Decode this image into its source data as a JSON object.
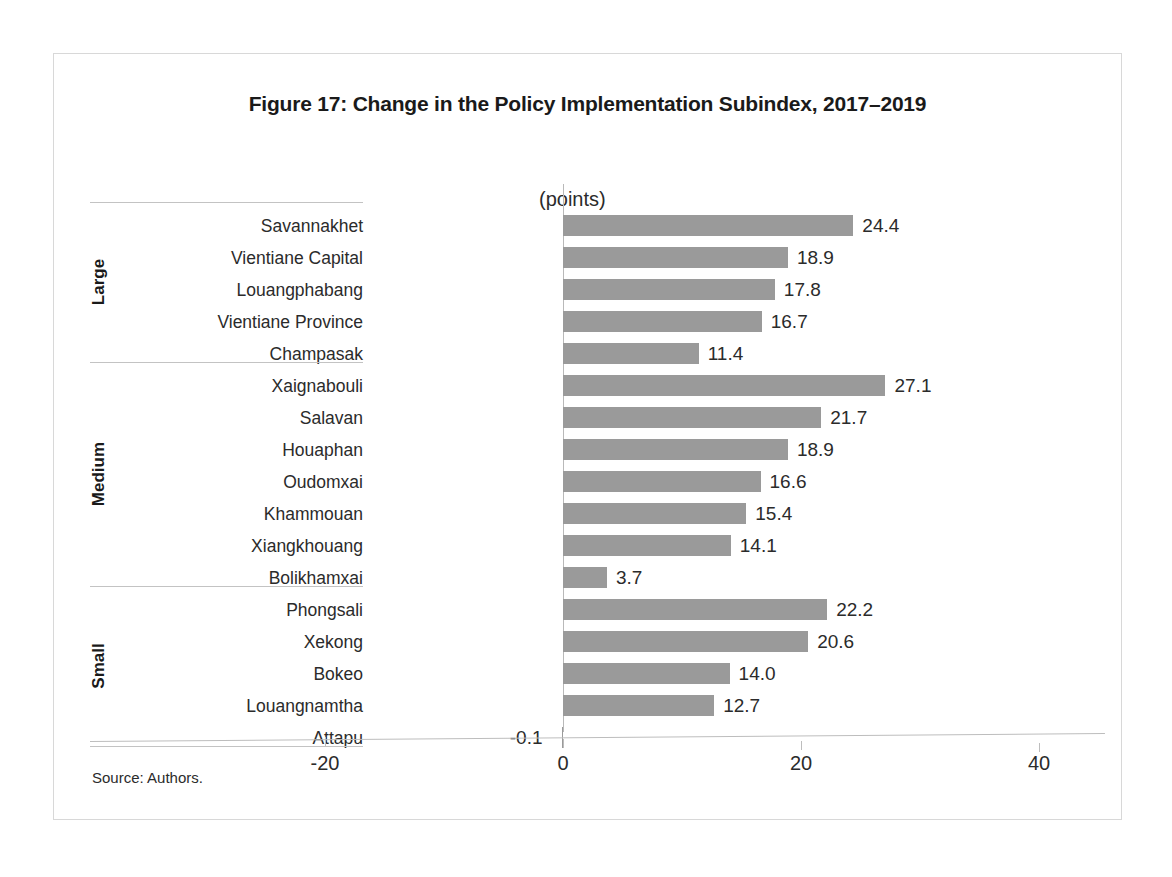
{
  "figure": {
    "title": "Figure 17: Change in the Policy Implementation Subindex, 2017–2019",
    "source_note": "Source: Authors.",
    "axis_unit_label": "(points)",
    "bar_color": "#9a9a9a",
    "frame_border_color": "#d8d8d8",
    "axis_color": "#bdbdbd"
  },
  "chart_data": {
    "type": "bar",
    "orientation": "horizontal",
    "title": "Figure 17: Change in the Policy Implementation Subindex, 2017–2019",
    "xlabel": "(points)",
    "ylabel": "",
    "xlim": [
      -30,
      40
    ],
    "xticks": [
      -20,
      0,
      20,
      40
    ],
    "xtick_labels": [
      "-20",
      "0",
      "20",
      "40"
    ],
    "grid": false,
    "legend": null,
    "categories": [
      "Savannakhet",
      "Vientiane Capital",
      "Louangphabang",
      "Vientiane Province",
      "Champasak",
      "Xaignabouli",
      "Salavan",
      "Houaphan",
      "Oudomxai",
      "Khammouan",
      "Xiangkhouang",
      "Bolikhamxai",
      "Phongsali",
      "Xekong",
      "Bokeo",
      "Louangnamtha",
      "Attapu"
    ],
    "values": [
      24.4,
      18.9,
      17.8,
      16.7,
      11.4,
      27.1,
      21.7,
      18.9,
      16.6,
      15.4,
      14.1,
      3.7,
      22.2,
      20.6,
      14.0,
      12.7,
      -0.1
    ],
    "value_labels": [
      "24.4",
      "18.9",
      "17.8",
      "16.7",
      "11.4",
      "27.1",
      "21.7",
      "18.9",
      "16.6",
      "15.4",
      "14.1",
      "3.7",
      "22.2",
      "20.6",
      "14.0",
      "12.7",
      "-0.1"
    ],
    "groups": [
      {
        "name": "Large",
        "start_index": 0,
        "count": 5
      },
      {
        "name": "Medium",
        "start_index": 5,
        "count": 7
      },
      {
        "name": "Small",
        "start_index": 12,
        "count": 5
      }
    ],
    "series": [
      {
        "name": "Change in Policy Implementation Subindex 2017-2019",
        "values": [
          24.4,
          18.9,
          17.8,
          16.7,
          11.4,
          27.1,
          21.7,
          18.9,
          16.6,
          15.4,
          14.1,
          3.7,
          22.2,
          20.6,
          14.0,
          12.7,
          -0.1
        ]
      }
    ]
  }
}
